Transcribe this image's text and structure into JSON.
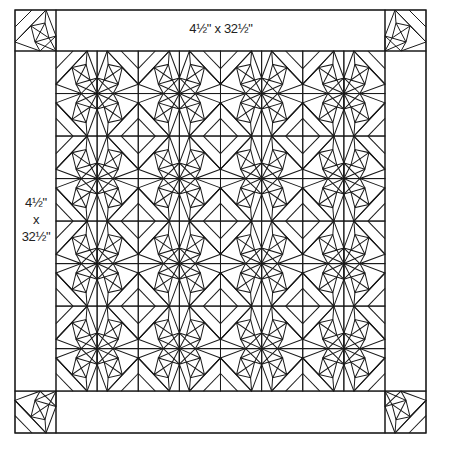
{
  "diagram": {
    "type": "quilt-layout",
    "colors": {
      "line": "#1a1a1a",
      "background": "#ffffff",
      "text": "#222222"
    },
    "border_top_label": "4½\" x 32½\"",
    "border_side_label": {
      "line1": "4½\"",
      "line2": "x",
      "line3": "32½\""
    },
    "center": {
      "columns": 8,
      "rows": 8,
      "block_group": "2x2 mirrored star blocks"
    },
    "corner_blocks": 4
  }
}
